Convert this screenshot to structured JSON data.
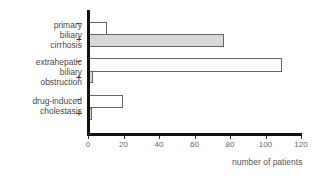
{
  "chart_data": {
    "type": "bar",
    "orientation": "horizontal",
    "title": "",
    "xlabel": "number of patients",
    "ylabel": "",
    "xlim": [
      0,
      120
    ],
    "xticks": [
      0,
      20,
      40,
      60,
      80,
      100,
      120
    ],
    "grid": false,
    "legend": null,
    "categories": [
      "primary biliary cirrhosis",
      "extrahepatic biliary obstruction",
      "drug-induced cholestasis"
    ],
    "category_labels": [
      "primary\nbiliary\ncirrhosis",
      "extrahepatic\nbiliary\nobstruction",
      "drug-induced\ncholestasis"
    ],
    "series": [
      {
        "name": "−",
        "fill": "#ffffff",
        "values": [
          10,
          109,
          19
        ]
      },
      {
        "name": "+",
        "fill": "#d8d8d8",
        "values": [
          76,
          2,
          1
        ]
      }
    ]
  },
  "signs": {
    "minus": "−",
    "plus": "+"
  },
  "colors": {
    "axis": "#111111",
    "bar_border": "#666666",
    "plus_fill": "#d8d8d8",
    "minus_fill": "#ffffff"
  }
}
